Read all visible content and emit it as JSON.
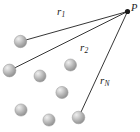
{
  "figure": {
    "background_color": "#ffffff",
    "width": 140,
    "height": 132,
    "field_point": {
      "label": "P",
      "label_x": 131,
      "label_y": 3,
      "dot_x": 127.5,
      "dot_y": 11.5,
      "dot_radius": 2.6,
      "dot_color": "#1a1a1a"
    },
    "vectors": [
      {
        "name": "r-1",
        "label_main": "r",
        "label_sub": "1",
        "label_x": 57,
        "label_y": 6,
        "from_x": 20.5,
        "from_y": 41.5,
        "to_x": 127.5,
        "to_y": 11.5,
        "stroke": "#1f1f1f",
        "stroke_width": 0.9
      },
      {
        "name": "r-2",
        "label_main": "r",
        "label_sub": "2",
        "label_x": 80,
        "label_y": 42,
        "from_x": 9.5,
        "from_y": 70.5,
        "to_x": 127.5,
        "to_y": 11.5,
        "stroke": "#1f1f1f",
        "stroke_width": 0.9
      },
      {
        "name": "r-N",
        "label_main": "r",
        "label_sub": "N",
        "label_x": 100,
        "label_y": 75,
        "from_x": 78.5,
        "from_y": 117.5,
        "to_x": 127.5,
        "to_y": 11.5,
        "stroke": "#1f1f1f",
        "stroke_width": 0.9
      }
    ],
    "masses": [
      {
        "name": "mass-1",
        "cx": 20.5,
        "cy": 41.5,
        "r": 6.2
      },
      {
        "name": "mass-2",
        "cx": 9.5,
        "cy": 70.5,
        "r": 6.4
      },
      {
        "name": "mass-3",
        "cx": 40.0,
        "cy": 76.0,
        "r": 6.0
      },
      {
        "name": "mass-4",
        "cx": 70.5,
        "cy": 65.0,
        "r": 6.0
      },
      {
        "name": "mass-5",
        "cx": 62.0,
        "cy": 92.5,
        "r": 6.1
      },
      {
        "name": "mass-6",
        "cx": 21.0,
        "cy": 110.0,
        "r": 6.1
      },
      {
        "name": "mass-7",
        "cx": 49.0,
        "cy": 120.0,
        "r": 6.1
      },
      {
        "name": "mass-8",
        "cx": 78.5,
        "cy": 117.5,
        "r": 6.3
      }
    ],
    "sphere_colors": {
      "highlight": "#e8e8e8",
      "midtone": "#b4b4b4",
      "shadow": "#8e8e8e",
      "outline": "#9a9a9a"
    }
  }
}
